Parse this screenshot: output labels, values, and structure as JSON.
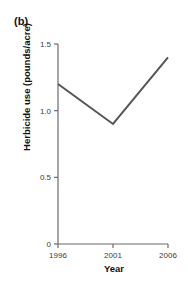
{
  "figure": {
    "panel_label": "(b)"
  },
  "chart_data": {
    "type": "line",
    "title": "",
    "subtitle": "",
    "xlabel": "Year",
    "ylabel": "Herbicide use (pounds/acre)",
    "x": [
      1996,
      2001,
      2006
    ],
    "values": [
      1.2,
      0.9,
      1.4
    ],
    "series": [
      {
        "name": "Herbicide use",
        "values": [
          1.2,
          0.9,
          1.4
        ],
        "color": "#555555"
      }
    ],
    "xlim": [
      1996,
      2006
    ],
    "ylim": [
      0,
      1.5
    ],
    "xticks": [
      1996,
      2001,
      2006
    ],
    "xtick_labels": [
      "1996",
      "2001",
      "2006"
    ],
    "yticks": [
      0,
      0.5,
      1.0,
      1.5
    ],
    "ytick_labels": [
      "0",
      "0.5",
      "1.0",
      "1.5"
    ],
    "grid": false,
    "legend": false,
    "legend_position": "none",
    "line_color": "#555555",
    "axis_color": "#6b6b6b",
    "markers": false
  }
}
